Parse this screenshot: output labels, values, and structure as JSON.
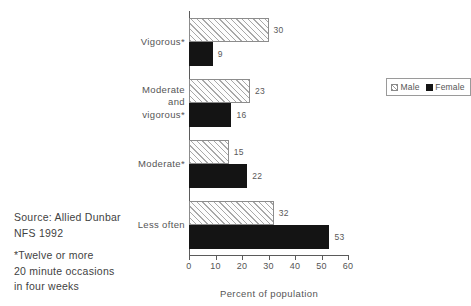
{
  "chart_data": {
    "type": "bar",
    "orientation": "horizontal",
    "title": "",
    "subtitle": "",
    "xlabel": "Percent of population",
    "ylabel": "",
    "xlim": [
      0,
      60
    ],
    "xticks": [
      0,
      10,
      20,
      30,
      40,
      50,
      60
    ],
    "xtick_labels": [
      "0",
      "10",
      "20",
      "30",
      "40",
      "50",
      "60"
    ],
    "grid": false,
    "legend_position": "right",
    "categories": [
      "Vigorous*",
      "Moderate and vigorous*",
      "Moderate*",
      "Less often"
    ],
    "category_lines": [
      [
        "Vigorous*"
      ],
      [
        "Moderate",
        "and",
        "vigorous*"
      ],
      [
        "Moderate*"
      ],
      [
        "Less often"
      ]
    ],
    "series": [
      {
        "name": "Male",
        "color": "#ffffff",
        "pattern": "diagonal-hatch",
        "values": [
          30,
          23,
          15,
          32
        ],
        "value_labels": [
          "30",
          "23",
          "15",
          "32"
        ]
      },
      {
        "name": "Female",
        "color": "#141414",
        "pattern": "solid",
        "values": [
          9,
          16,
          22,
          53
        ],
        "value_labels": [
          "9",
          "16",
          "22",
          "53"
        ]
      }
    ]
  },
  "legend": {
    "entries": [
      {
        "label": "Male",
        "swatch": "hatched-swatch"
      },
      {
        "label": "Female",
        "swatch": "solid-black-swatch"
      }
    ]
  },
  "notes": {
    "source_line_1": "Source: Allied Dunbar",
    "source_line_2": "NFS 1992",
    "footnote_line_1": "*Twelve or more",
    "footnote_line_2": "20 minute occasions",
    "footnote_line_3": "in four weeks"
  },
  "page_bleed": {
    "top": "",
    "bottom": ""
  }
}
